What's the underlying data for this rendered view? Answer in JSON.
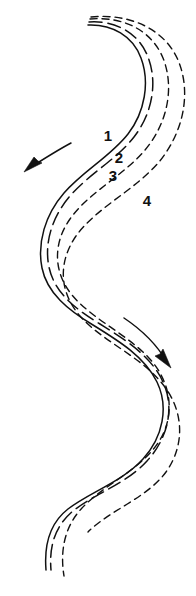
{
  "figure": {
    "kind": "meander-migration-diagram",
    "background_color": "#ffffff",
    "ink_color": "#111111",
    "width": 196,
    "height": 596
  },
  "labels": [
    {
      "text": "1",
      "x": 108,
      "y": 137
    },
    {
      "text": "2",
      "x": 119,
      "y": 159
    },
    {
      "text": "3",
      "x": 113,
      "y": 177
    },
    {
      "text": "4",
      "x": 147,
      "y": 202
    }
  ],
  "channels": [
    {
      "id": "channel-1",
      "label": "1",
      "style": "solid",
      "stroke_width": 1.5,
      "dash": "none",
      "d": "M 88 25 C 112 24, 133 36, 141 58 C 150 82, 145 112, 128 134 C 110 157, 84 170, 64 193 C 45 215, 37 243, 42 268 C 47 293, 68 310, 93 325 C 119 341, 145 357, 157 382 C 169 407, 163 437, 143 459 C 122 482, 90 492, 68 509 C 50 523, 44 545, 46 570"
    },
    {
      "id": "channel-2",
      "label": "2",
      "style": "long-dash",
      "stroke_width": 1.5,
      "dash": "13 6",
      "d": "M 89 22 C 115 20, 139 33, 148 57 C 158 83, 152 114, 134 137 C 116 160, 90 173, 70 196 C 52 217, 44 243, 49 267 C 54 292, 75 309, 100 324 C 126 340, 152 357, 163 382 C 175 408, 168 438, 147 461 C 126 484, 94 494, 73 511 C 55 526, 49 546, 51 570"
    },
    {
      "id": "channel-3",
      "label": "3",
      "style": "short-dash",
      "stroke_width": 1.4,
      "dash": "7 5",
      "d": "M 90 19 C 124 16, 152 31, 163 58 C 175 88, 167 124, 145 150 C 122 177, 89 192, 70 219 C 53 243, 53 272, 72 295 C 92 319, 125 333, 148 357 C 172 382, 176 416, 158 443 C 140 470, 105 484, 82 508 C 64 527, 60 552, 64 576"
    },
    {
      "id": "channel-4",
      "label": "4",
      "style": "short-dash",
      "stroke_width": 1.4,
      "dash": "7 5",
      "d": "M 91 17 C 131 13, 165 30, 178 60 C 192 93, 183 133, 159 162 C 134 191, 97 207, 76 236 C 58 262, 59 292, 80 316 C 102 341, 138 355, 160 381 C 184 408, 186 444, 166 472 C 147 498, 110 510, 88 532"
    }
  ],
  "arrows": [
    {
      "id": "flow-arrow-upper-left",
      "direction": "down-left",
      "shaft_d": "M 71 143 C 56 151, 42 160, 28 169",
      "head_points": "24,172 42,163 38,161 34,157"
    },
    {
      "id": "flow-arrow-lower-right",
      "direction": "down-right",
      "shaft_d": "M 124 318 C 142 330, 157 345, 167 362",
      "head_points": "171,368 163,349 160,354 155,356"
    }
  ]
}
